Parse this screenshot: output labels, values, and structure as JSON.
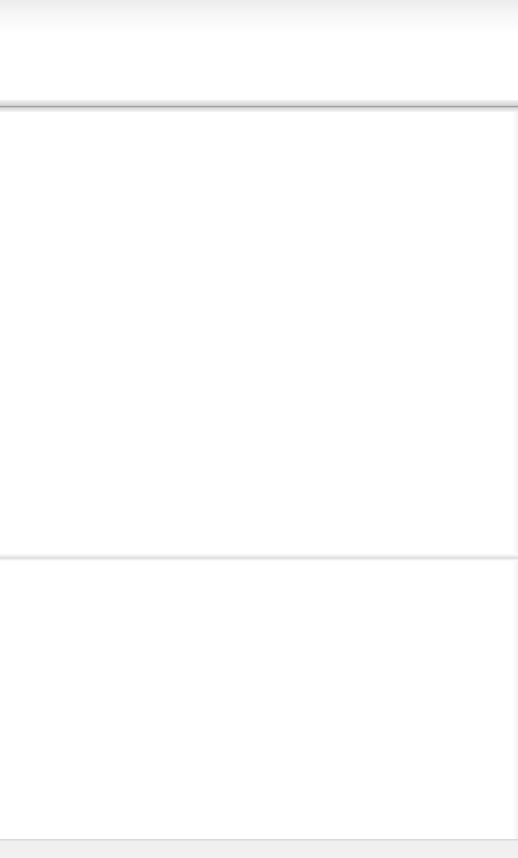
{
  "page": {
    "width": 518,
    "height": 858,
    "background": "#ffffff",
    "note_visible_text": null
  },
  "layout": {
    "header_band": {
      "color": "#f0f0f0"
    },
    "divider_top": {
      "color": "#9a9a9a"
    },
    "divider_mid": {
      "color": "#dcdcdc"
    },
    "footer_band": {
      "color": "#eeeeee"
    }
  }
}
